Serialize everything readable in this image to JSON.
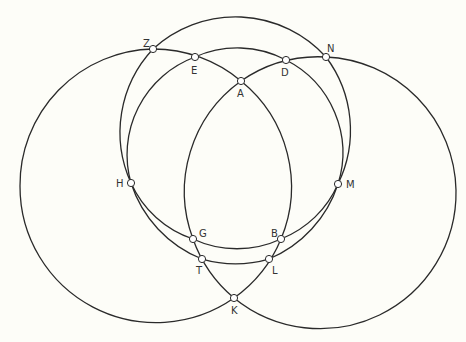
{
  "figure": {
    "type": "geometric construction of intersecting circles",
    "colors": {
      "background": "#fdfdf8",
      "stroke": "#2a2a2a",
      "point_fill": "#ffffff",
      "label": "#333333"
    },
    "points": [
      {
        "id": "Z",
        "label": "Z",
        "x": 153,
        "y": 49,
        "lx": 143,
        "ly": 47
      },
      {
        "id": "E",
        "label": "E",
        "x": 195,
        "y": 57,
        "lx": 191,
        "ly": 74
      },
      {
        "id": "A",
        "label": "A",
        "x": 241,
        "y": 81,
        "lx": 237,
        "ly": 97
      },
      {
        "id": "D",
        "label": "D",
        "x": 286,
        "y": 60,
        "lx": 281,
        "ly": 76
      },
      {
        "id": "N",
        "label": "N",
        "x": 326,
        "y": 57,
        "lx": 327,
        "ly": 52
      },
      {
        "id": "H",
        "label": "H",
        "x": 131,
        "y": 183,
        "lx": 116,
        "ly": 187
      },
      {
        "id": "M",
        "label": "M",
        "x": 338,
        "y": 184,
        "lx": 346,
        "ly": 188
      },
      {
        "id": "G",
        "label": "G",
        "x": 193,
        "y": 239,
        "lx": 199,
        "ly": 237
      },
      {
        "id": "B",
        "label": "B",
        "x": 281,
        "y": 239,
        "lx": 271,
        "ly": 237
      },
      {
        "id": "T",
        "label": "T",
        "x": 202,
        "y": 259,
        "lx": 196,
        "ly": 274
      },
      {
        "id": "L",
        "label": "L",
        "x": 269,
        "y": 259,
        "lx": 272,
        "ly": 274
      },
      {
        "id": "K",
        "label": "K",
        "x": 234,
        "y": 298,
        "lx": 231,
        "ly": 314
      }
    ],
    "curves": [
      {
        "name": "outer-top-circle",
        "through": [
          "Z",
          "N",
          "M",
          "L",
          "T",
          "H"
        ]
      },
      {
        "name": "inner-circle",
        "through": [
          "E",
          "D",
          "M",
          "B",
          "G",
          "H"
        ]
      },
      {
        "name": "left-large-circle",
        "through": [
          "Z",
          "E",
          "A",
          "B",
          "L",
          "K"
        ]
      },
      {
        "name": "right-large-circle",
        "through": [
          "N",
          "D",
          "A",
          "G",
          "T",
          "K"
        ]
      }
    ]
  }
}
